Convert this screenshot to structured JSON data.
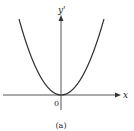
{
  "figure": {
    "caption": "(a)",
    "x_axis_label": "x",
    "y_axis_label": "y'",
    "origin_label": "0",
    "curve": "parabola",
    "colors": {
      "curve": "#333333",
      "axis": "#555555",
      "text": "#222222",
      "background": "#ffffff"
    }
  }
}
